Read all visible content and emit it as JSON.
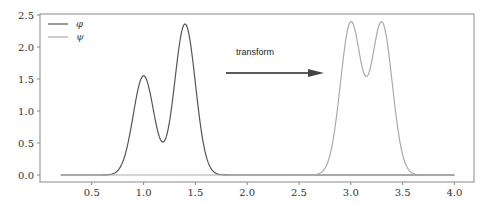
{
  "chart_data": {
    "type": "line",
    "title": "",
    "xlabel": "",
    "ylabel": "",
    "xlim": [
      0.0,
      4.2
    ],
    "ylim": [
      -0.1,
      2.55
    ],
    "xticks": [
      0.5,
      1.0,
      1.5,
      2.0,
      2.5,
      3.0,
      3.5,
      4.0
    ],
    "xtick_labels": [
      "0.5",
      "1.0",
      "1.5",
      "2.0",
      "2.5",
      "3.0",
      "3.5",
      "4.0"
    ],
    "yticks": [
      0.0,
      0.5,
      1.0,
      1.5,
      2.0,
      2.5
    ],
    "ytick_labels": [
      "0.0",
      "0.5",
      "1.0",
      "1.5",
      "2.0",
      "2.5"
    ],
    "grid": false,
    "legend_position": "upper left",
    "x_range": [
      0.2,
      4.0
    ],
    "series": [
      {
        "name": "φ",
        "color": "#555555",
        "description": "sum of two Gaussians",
        "components": [
          {
            "center": 1.0,
            "amplitude": 1.55,
            "sigma": 0.1
          },
          {
            "center": 1.4,
            "amplitude": 2.36,
            "sigma": 0.1
          }
        ],
        "key_points": [
          {
            "x": 1.0,
            "y": 1.6
          },
          {
            "x": 1.18,
            "y": 0.53
          },
          {
            "x": 1.4,
            "y": 2.38
          }
        ]
      },
      {
        "name": "ψ",
        "color": "#aaaaaa",
        "description": "sum of two Gaussians",
        "components": [
          {
            "center": 3.0,
            "amplitude": 2.37,
            "sigma": 0.1
          },
          {
            "center": 3.3,
            "amplitude": 2.37,
            "sigma": 0.1
          }
        ],
        "key_points": [
          {
            "x": 3.0,
            "y": 2.4
          },
          {
            "x": 3.15,
            "y": 1.55
          },
          {
            "x": 3.3,
            "y": 2.4
          }
        ]
      }
    ],
    "annotations": [
      {
        "type": "text",
        "text": "transform",
        "x": 1.85,
        "y": 1.9
      },
      {
        "type": "arrow",
        "from": [
          1.8,
          1.6
        ],
        "to": [
          2.72,
          1.6
        ],
        "color": "#222222"
      }
    ]
  },
  "legend": {
    "items": [
      {
        "label": "φ",
        "color": "#555555"
      },
      {
        "label": "ψ",
        "color": "#aaaaaa"
      }
    ]
  },
  "annotation": {
    "text": "transform"
  }
}
